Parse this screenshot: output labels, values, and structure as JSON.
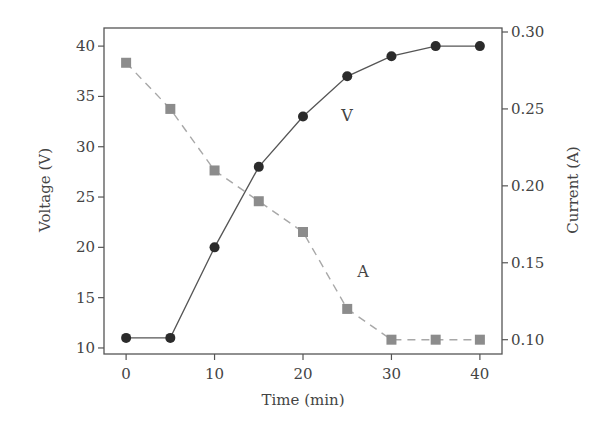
{
  "chart_data": {
    "type": "line",
    "title": "",
    "x": [
      0,
      5,
      10,
      15,
      20,
      25,
      30,
      35,
      40
    ],
    "xlabel": "Time (min)",
    "xlim": [
      -2.5,
      42.5
    ],
    "xticks": [
      0,
      10,
      20,
      30,
      40
    ],
    "ylabel_left": "Voltage (V)",
    "ylim_left": [
      9.4,
      41.8
    ],
    "yticks_left": [
      10,
      15,
      20,
      25,
      30,
      35,
      40
    ],
    "ylabel_right": "Current (A)",
    "ylim_right": [
      0.0907,
      0.3026
    ],
    "yticks_right": [
      "0.10",
      "0.15",
      "0.20",
      "0.25",
      "0.30"
    ],
    "grid": false,
    "legend": "inline labels",
    "series": [
      {
        "name": "V",
        "axis": "left",
        "marker": "circle",
        "line": "solid",
        "color": "#2b2b2b",
        "values": [
          11,
          11,
          20,
          28,
          33,
          37,
          39,
          40,
          40
        ],
        "label_pos": {
          "x": 25,
          "y": 32.8
        }
      },
      {
        "name": "A",
        "axis": "right",
        "marker": "square",
        "line": "dashed",
        "color": "#8c8c8c",
        "values": [
          0.28,
          0.25,
          0.21,
          0.19,
          0.17,
          0.12,
          0.1,
          0.1,
          0.1
        ],
        "label_pos": {
          "x": 26.8,
          "y": 0.142
        }
      }
    ]
  }
}
